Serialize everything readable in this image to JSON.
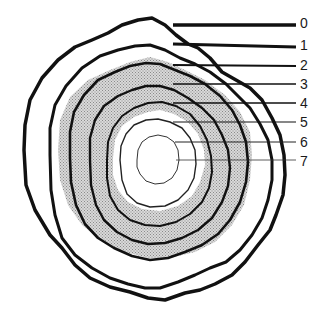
{
  "diagram": {
    "type": "concentric-rings",
    "labels": [
      {
        "id": "0",
        "text": "0",
        "y": 22
      },
      {
        "id": "1",
        "text": "1",
        "y": 45
      },
      {
        "id": "2",
        "text": "2",
        "y": 64
      },
      {
        "id": "3",
        "text": "3",
        "y": 83
      },
      {
        "id": "4",
        "text": "4",
        "y": 102
      },
      {
        "id": "5",
        "text": "5",
        "y": 121
      },
      {
        "id": "6",
        "text": "6",
        "y": 141
      },
      {
        "id": "7",
        "text": "7",
        "y": 160
      }
    ],
    "colors": {
      "stroke": "#111111",
      "stipple": "#bdbdbd",
      "background": "#ffffff"
    }
  }
}
